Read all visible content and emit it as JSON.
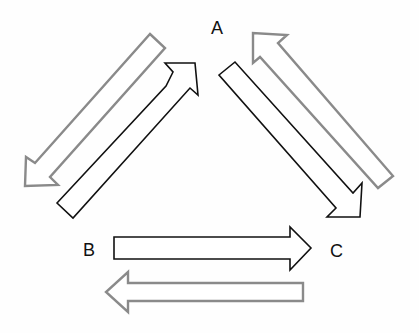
{
  "diagram": {
    "type": "cycle-triangle",
    "nodes": [
      {
        "id": "A",
        "label": "A",
        "x": 211,
        "y": 34
      },
      {
        "id": "B",
        "label": "B",
        "x": 83,
        "y": 256
      },
      {
        "id": "C",
        "label": "C",
        "x": 330,
        "y": 257
      }
    ],
    "edges": [
      {
        "from": "B",
        "to": "A",
        "style": "black-outline",
        "color": "#111111",
        "points": "57,203 166,86 173,72 165,63 195,63 198,95 190,88 73,218"
      },
      {
        "from": "A",
        "to": "B",
        "style": "gray-outline",
        "color": "#8a8a8a",
        "points": "150,34 165,48 50,177 58,185 25,186 26,157 35,163"
      },
      {
        "from": "A",
        "to": "C",
        "style": "black-outline",
        "color": "#111111",
        "points": "219,75 235,62 353,193 362,183 360,217 327,217 336,208"
      },
      {
        "from": "C",
        "to": "A",
        "style": "gray-outline",
        "color": "#8a8a8a",
        "points": "393,176 378,188 260,57 253,63 253,33 287,35 278,43"
      },
      {
        "from": "B",
        "to": "C",
        "style": "black-outline",
        "color": "#111111",
        "points": "114,237 290,237 290,227 311,248 290,270 290,259 114,259"
      },
      {
        "from": "C",
        "to": "B",
        "style": "gray-outline",
        "color": "#8a8a8a",
        "points": "303,283 303,301 128,301 128,312 106,292 128,272 128,283"
      }
    ]
  }
}
